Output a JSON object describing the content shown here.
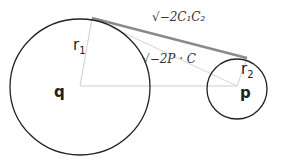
{
  "diagram": {
    "labels": {
      "q": "q",
      "p": "p",
      "r1": "r",
      "r1_sub": "1",
      "r2": "r",
      "r2_sub": "2",
      "tangent_length": "√−2C₁C₂",
      "center_expr": "√−2P · C"
    },
    "colors": {
      "circle": "#222222",
      "tangent": "#8a8a8a",
      "thin_lines": "#c8c8c8"
    }
  }
}
